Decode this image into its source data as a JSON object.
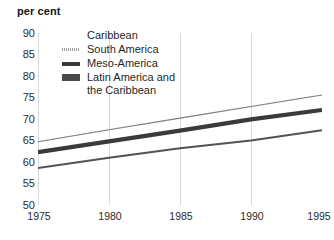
{
  "chart_data": {
    "type": "line",
    "title": "",
    "ylabel": "per cent",
    "xlabel": "",
    "ylim": [
      50,
      90
    ],
    "xlim": [
      1975,
      1995
    ],
    "grid": "vertical-faint",
    "legend_position": "top-center",
    "y_ticks": [
      "90",
      "85",
      "80",
      "75",
      "70",
      "65",
      "60",
      "55",
      "50"
    ],
    "y_tick_values": [
      90,
      85,
      80,
      75,
      70,
      65,
      60,
      55,
      50
    ],
    "x_ticks": [
      "1975",
      "1980",
      "1985",
      "1990",
      "1995"
    ],
    "x_tick_values": [
      1975,
      1980,
      1985,
      1990,
      1995
    ],
    "x": [
      1975,
      1980,
      1985,
      1990,
      1995
    ],
    "series": [
      {
        "name": "Caribbean",
        "style": "thin-dotted",
        "color": "#6e6e6e",
        "values": [
          64.7,
          67.5,
          70.2,
          72.9,
          75.6
        ]
      },
      {
        "name": "South America",
        "style": "stippled",
        "color": "#9a9a9a",
        "values": [
          64.7,
          67.5,
          70.2,
          72.9,
          75.6
        ]
      },
      {
        "name": "Meso-America",
        "style": "thick-solid",
        "color": "#3a3a3a",
        "values": [
          62.3,
          64.8,
          67.3,
          69.9,
          72.1
        ]
      },
      {
        "name": "Latin America and\nthe Caribbean",
        "style": "medium-solid",
        "color": "#4a4a4a",
        "values": [
          58.6,
          61.0,
          63.2,
          65.0,
          67.4
        ]
      }
    ]
  },
  "axis_title": "per cent",
  "legend": {
    "items": [
      {
        "label": "Caribbean",
        "marker": "caribbean"
      },
      {
        "label": "South America",
        "marker": "south"
      },
      {
        "label": "Meso-America",
        "marker": "meso"
      },
      {
        "label": "Latin America and\nthe Caribbean",
        "marker": "latin"
      }
    ]
  }
}
